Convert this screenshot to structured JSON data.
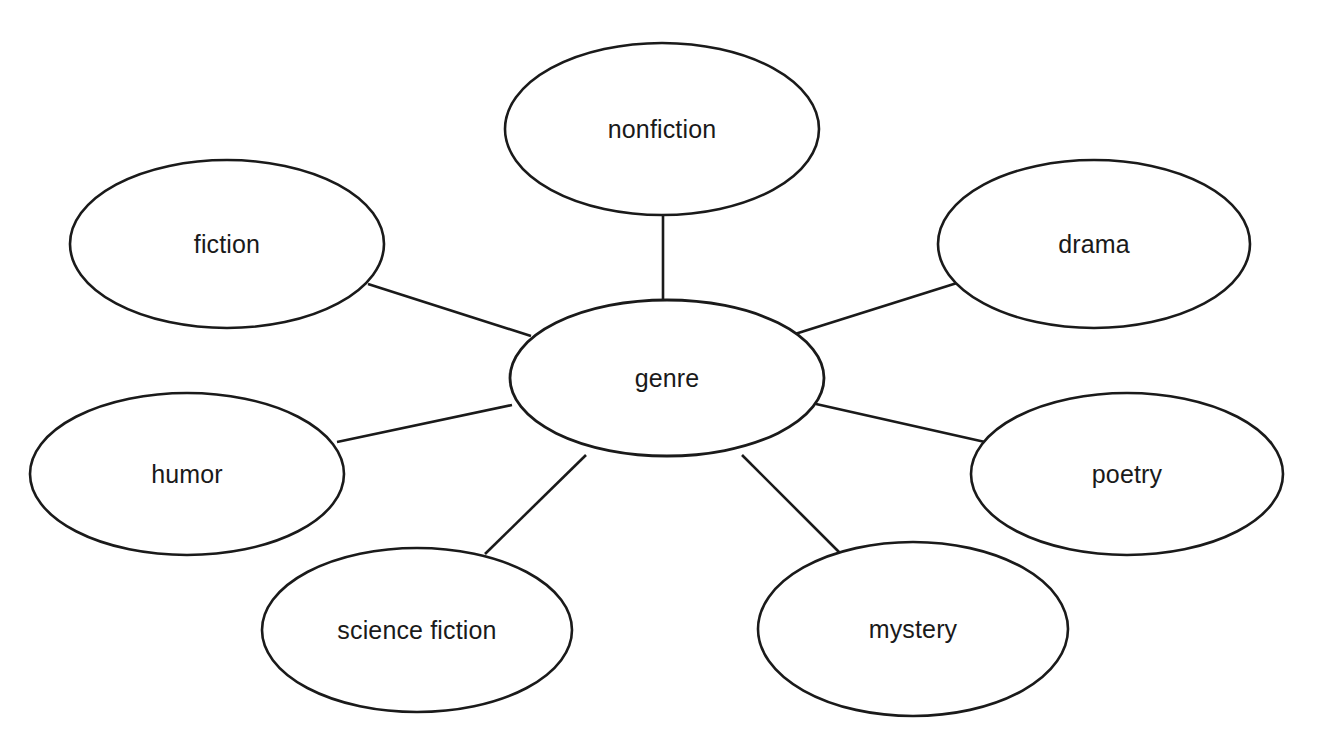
{
  "diagram": {
    "type": "word-web",
    "title": "genre",
    "background_color": "#ffffff",
    "stroke_color": "#1a1a1a",
    "text_color": "#1a1a1a",
    "center": {
      "id": "genre",
      "label": "genre",
      "cx": 667,
      "cy": 378,
      "rx": 157,
      "ry": 78
    },
    "nodes": [
      {
        "id": "nonfiction",
        "label": "nonfiction",
        "cx": 662,
        "cy": 129,
        "rx": 157,
        "ry": 86,
        "position": "top"
      },
      {
        "id": "drama",
        "label": "drama",
        "cx": 1094,
        "cy": 244,
        "rx": 156,
        "ry": 84,
        "position": "top-right"
      },
      {
        "id": "poetry",
        "label": "poetry",
        "cx": 1127,
        "cy": 474,
        "rx": 156,
        "ry": 81,
        "position": "right"
      },
      {
        "id": "mystery",
        "label": "mystery",
        "cx": 913,
        "cy": 629,
        "rx": 155,
        "ry": 87,
        "position": "bottom-right"
      },
      {
        "id": "science-fiction",
        "label": "science fiction",
        "cx": 417,
        "cy": 630,
        "rx": 155,
        "ry": 82,
        "position": "bottom-left"
      },
      {
        "id": "humor",
        "label": "humor",
        "cx": 187,
        "cy": 474,
        "rx": 157,
        "ry": 81,
        "position": "left"
      },
      {
        "id": "fiction",
        "label": "fiction",
        "cx": 227,
        "cy": 244,
        "rx": 157,
        "ry": 84,
        "position": "top-left"
      }
    ],
    "edges": [
      {
        "id": "edge-genre-nonfiction",
        "from": "genre",
        "to": "nonfiction",
        "x1": 663,
        "y1": 300,
        "x2": 663,
        "y2": 213
      },
      {
        "id": "edge-genre-drama",
        "from": "genre",
        "to": "drama",
        "x1": 795,
        "y1": 334,
        "x2": 957,
        "y2": 283
      },
      {
        "id": "edge-genre-poetry",
        "from": "genre",
        "to": "poetry",
        "x1": 816,
        "y1": 404,
        "x2": 985,
        "y2": 442
      },
      {
        "id": "edge-genre-mystery",
        "from": "genre",
        "to": "mystery",
        "x1": 742,
        "y1": 455,
        "x2": 841,
        "y2": 554
      },
      {
        "id": "edge-genre-science-fiction",
        "from": "genre",
        "to": "science-fiction",
        "x1": 586,
        "y1": 455,
        "x2": 485,
        "y2": 554
      },
      {
        "id": "edge-genre-humor",
        "from": "genre",
        "to": "humor",
        "x1": 512,
        "y1": 405,
        "x2": 337,
        "y2": 442
      },
      {
        "id": "edge-genre-fiction",
        "from": "genre",
        "to": "fiction",
        "x1": 531,
        "y1": 336,
        "x2": 368,
        "y2": 284
      }
    ]
  }
}
